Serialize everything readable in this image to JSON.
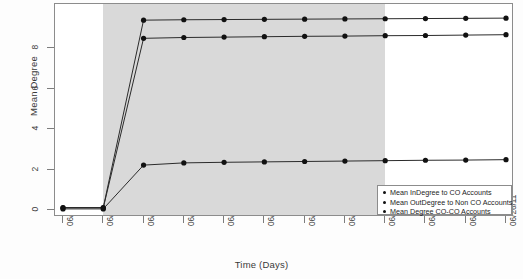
{
  "chart_data": {
    "type": "line",
    "title": "",
    "xlabel": "Time (Days)",
    "ylabel": "Mean Degree",
    "categories": [
      "06/15/11",
      "06/16/11",
      "06/17/11",
      "06/18/11",
      "06/19/11",
      "06/20/11",
      "06/21/11",
      "06/22/11",
      "06/23/11",
      "06/24/11",
      "06/25/11",
      "06/26/11"
    ],
    "ylim": [
      -0.35,
      10.2
    ],
    "yticks": [
      0,
      2,
      4,
      6,
      8
    ],
    "ytick_labels": [
      "0",
      "2",
      "4",
      "6",
      "8"
    ],
    "grid": false,
    "legend_position": "bottom-right",
    "series": [
      {
        "name": "Mean InDegree to CO Accounts",
        "values": [
          0.1,
          0.1,
          8.5,
          8.54,
          8.56,
          8.58,
          8.6,
          8.61,
          8.63,
          8.64,
          8.66,
          8.68
        ]
      },
      {
        "name": "Mean OutDegree to Non CO Accounts",
        "values": [
          0.12,
          0.12,
          9.4,
          9.42,
          9.43,
          9.44,
          9.45,
          9.46,
          9.47,
          9.48,
          9.49,
          9.5
        ]
      },
      {
        "name": "Mean Degree CO-CO Accounts",
        "values": [
          0.05,
          0.05,
          2.22,
          2.33,
          2.36,
          2.38,
          2.4,
          2.42,
          2.44,
          2.46,
          2.47,
          2.49
        ]
      }
    ],
    "shaded_region": {
      "from": "06/16/11",
      "to": "06/23/11",
      "color": "#d6d6d6"
    },
    "marker_color": "#111111",
    "line_color": "#2b2b2b"
  },
  "legend": {
    "items": [
      "Mean InDegree to CO Accounts",
      "Mean OutDegree to Non CO Accounts",
      "Mean Degree CO-CO Accounts"
    ]
  }
}
